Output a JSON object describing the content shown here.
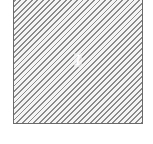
{
  "diagram": {
    "region": {
      "label": "I",
      "fill_pattern": "diagonal-hatch",
      "hatch_color": "#8a8a8a",
      "border_color": "#6a6a6a",
      "background_color": "#ffffff"
    }
  }
}
